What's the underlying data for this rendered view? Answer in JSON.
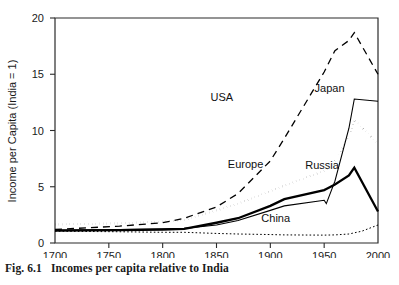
{
  "figure": {
    "caption_number": "Fig. 6.1",
    "caption_text": "Incomes per capita relative to India"
  },
  "chart_data": {
    "type": "line",
    "title": "",
    "xlabel": "",
    "ylabel": "Income per Capita (India = 1)",
    "xlim": [
      1700,
      2000
    ],
    "ylim": [
      0,
      20
    ],
    "xticks": [
      1700,
      1750,
      1800,
      1850,
      1900,
      1950,
      2000
    ],
    "xtick_labels": [
      "1700",
      "1750",
      "1800",
      "1850",
      "1900",
      "1950",
      "2000"
    ],
    "yticks": [
      0,
      5,
      10,
      15,
      20
    ],
    "ytick_labels": [
      "0",
      "5",
      "10",
      "15",
      "20"
    ],
    "grid": false,
    "legend": "inline-labels",
    "series": [
      {
        "name": "USA",
        "style": "dashed",
        "stroke_width": 1.3,
        "dash": "7,5",
        "label_x": 1855,
        "label_y": 12.6,
        "x": [
          1700,
          1760,
          1800,
          1820,
          1850,
          1870,
          1900,
          1913,
          1950,
          1960,
          1973,
          1978,
          2000
        ],
        "y": [
          1.2,
          1.5,
          1.8,
          2.2,
          3.2,
          4.4,
          7.3,
          9.3,
          15.2,
          17.1,
          18.0,
          18.7,
          15.0
        ]
      },
      {
        "name": "Japan",
        "style": "solid-thin",
        "stroke_width": 1.1,
        "dash": "none",
        "label_x": 1955,
        "label_y": 13.4,
        "x": [
          1700,
          1760,
          1800,
          1820,
          1850,
          1870,
          1900,
          1913,
          1950,
          1952,
          1960,
          1973,
          1978,
          2000
        ],
        "y": [
          1.15,
          1.2,
          1.25,
          1.3,
          1.6,
          2.0,
          2.9,
          3.3,
          3.8,
          3.5,
          5.5,
          10.2,
          12.8,
          12.6
        ]
      },
      {
        "name": "Europe",
        "style": "dotted",
        "stroke_width": 2.2,
        "dash": "0.1,3.6",
        "label_x": 1877,
        "label_y": 6.7,
        "x": [
          1700,
          1760,
          1800,
          1820,
          1850,
          1870,
          1900,
          1913,
          1950,
          1960,
          1973,
          1978,
          2000
        ],
        "y": [
          1.65,
          1.75,
          1.9,
          2.05,
          2.9,
          3.5,
          4.6,
          5.1,
          6.4,
          7.3,
          9.5,
          11.0,
          8.8
        ]
      },
      {
        "name": "Russia",
        "style": "solid-thick",
        "stroke_width": 2.3,
        "dash": "none",
        "label_x": 1948,
        "label_y": 6.6,
        "x": [
          1700,
          1760,
          1800,
          1820,
          1850,
          1870,
          1900,
          1913,
          1950,
          1952,
          1960,
          1973,
          1978,
          2000
        ],
        "y": [
          1.1,
          1.15,
          1.2,
          1.25,
          1.8,
          2.2,
          3.3,
          3.9,
          4.7,
          4.8,
          5.2,
          6.0,
          6.7,
          2.8
        ]
      },
      {
        "name": "China",
        "style": "fine-dotted",
        "stroke_width": 1.0,
        "dash": "1.6,2.2",
        "label_x": 1905,
        "label_y": 1.85,
        "x": [
          1700,
          1760,
          1800,
          1820,
          1850,
          1870,
          1900,
          1913,
          1950,
          1960,
          1973,
          1985,
          2000
        ],
        "y": [
          1.05,
          1.0,
          0.95,
          0.95,
          0.85,
          0.8,
          0.75,
          0.72,
          0.7,
          0.72,
          0.8,
          1.05,
          1.6
        ]
      }
    ]
  }
}
